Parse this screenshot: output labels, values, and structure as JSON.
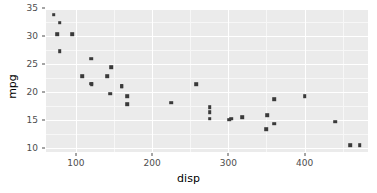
{
  "chart_data": {
    "type": "scatter",
    "title": "",
    "subtitle": "",
    "xlabel": "disp",
    "ylabel": "mpg",
    "xlim": [
      60.9,
      483.1
    ],
    "ylim": [
      9.225,
      35.075
    ],
    "xticks": [
      100,
      200,
      300,
      400
    ],
    "xtick_labels": [
      "100",
      "200",
      "300",
      "400"
    ],
    "yticks": [
      10,
      15,
      20,
      25,
      30,
      35
    ],
    "ytick_labels": [
      "10",
      "15",
      "20",
      "25",
      "30",
      "35"
    ],
    "x_minor_ticks": [
      150,
      250,
      350,
      450
    ],
    "y_minor_ticks": [
      12.5,
      17.5,
      22.5,
      27.5,
      32.5
    ],
    "grid": true,
    "legend": "none",
    "panel_background": "#ebebeb",
    "grid_major_color": "#ffffff",
    "grid_minor_color": "#f7f7f7",
    "point_color": "#3a3a3a",
    "point_shape": "square",
    "x": [
      160,
      160,
      108,
      258,
      360,
      225,
      360,
      146.7,
      140.8,
      167.6,
      167.6,
      275.8,
      275.8,
      275.8,
      472,
      460,
      440,
      78.7,
      75.7,
      71.1,
      120.1,
      318,
      304,
      350,
      400,
      79,
      120.3,
      95.1,
      351,
      145,
      301,
      121
    ],
    "y": [
      21,
      21,
      22.8,
      21.4,
      18.7,
      18.1,
      14.3,
      24.4,
      22.8,
      19.2,
      17.8,
      16.4,
      17.3,
      15.2,
      10.4,
      10.4,
      14.7,
      32.4,
      30.4,
      33.9,
      21.5,
      15.5,
      15.2,
      13.3,
      19.2,
      27.3,
      26,
      30.4,
      15.8,
      19.7,
      15,
      21.4
    ]
  },
  "axis_titles": {
    "x": "disp",
    "y": "mpg"
  }
}
